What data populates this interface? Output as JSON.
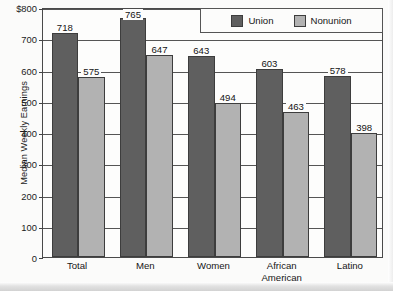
{
  "chart_data": {
    "type": "bar",
    "title": "",
    "subtitle": "",
    "xlabel": "",
    "ylabel": "Median Weekly Earnings",
    "ylim": [
      0,
      800
    ],
    "y_ticks": [
      0,
      100,
      200,
      300,
      400,
      500,
      600,
      700,
      800
    ],
    "y_tick_labels": [
      "0",
      "100",
      "200",
      "300",
      "400",
      "500",
      "600",
      "700",
      "$800"
    ],
    "grid": true,
    "legend_position": "top-right",
    "categories": [
      "Total",
      "Men",
      "Women",
      "African American",
      "Latino"
    ],
    "category_lines": [
      [
        "Total"
      ],
      [
        "Men"
      ],
      [
        "Women"
      ],
      [
        "African",
        "American"
      ],
      [
        "Latino"
      ]
    ],
    "series": [
      {
        "name": "Union",
        "color": "#5f5f5f",
        "values": [
          718,
          765,
          643,
          603,
          578
        ]
      },
      {
        "name": "Nonunion",
        "color": "#b2b2b2",
        "values": [
          575,
          647,
          494,
          463,
          398
        ]
      }
    ]
  },
  "legend": {
    "items": [
      {
        "label": "Union",
        "swatch": "union"
      },
      {
        "label": "Nonunion",
        "swatch": "nonunion"
      }
    ]
  }
}
